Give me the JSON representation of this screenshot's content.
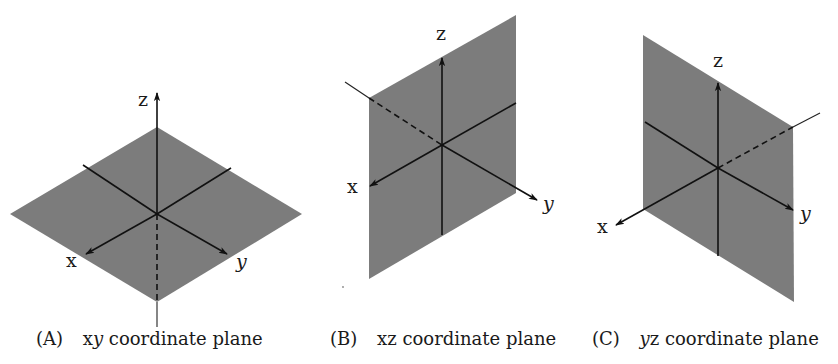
{
  "figure": {
    "panels": [
      {
        "id": "A",
        "tag": "(A)",
        "caption_var": "xy",
        "caption_var_parts": [
          "x",
          "y"
        ],
        "caption_rest": "coordinate plane",
        "plane": "xy",
        "axis_labels": {
          "x": "x",
          "y": "y",
          "z": "z"
        }
      },
      {
        "id": "B",
        "tag": "(B)",
        "caption_var": "xz",
        "caption_var_parts": [
          "x",
          "z"
        ],
        "caption_rest": "coordinate plane",
        "plane": "xz",
        "axis_labels": {
          "x": "x",
          "y": "y",
          "z": "z"
        }
      },
      {
        "id": "C",
        "tag": "(C)",
        "caption_var": "yz",
        "caption_var_parts": [
          "y",
          "z"
        ],
        "caption_rest": "coordinate plane",
        "plane": "yz",
        "axis_labels": {
          "x": "x",
          "y": "y",
          "z": "z"
        }
      }
    ],
    "colors": {
      "plane_fill": "#7c7c7c",
      "axis": "#111111",
      "background": "#ffffff"
    }
  }
}
